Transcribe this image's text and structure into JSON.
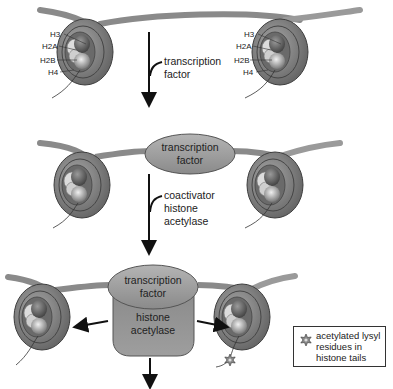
{
  "diagram": {
    "title": "",
    "stage1": {
      "histone_labels_left": [
        "H3",
        "H2A",
        "H2B",
        "H4"
      ],
      "histone_labels_right": [
        "H3",
        "H2A",
        "H2B",
        "H4"
      ],
      "arrow_label_line1": "transcription",
      "arrow_label_line2": "factor"
    },
    "stage2": {
      "tf_label_line1": "transcription",
      "tf_label_line2": "factor",
      "arrow_label_line1": "coactivator",
      "arrow_label_line2": "histone",
      "arrow_label_line3": "acetylase"
    },
    "stage3": {
      "tf_label_line1": "transcription",
      "tf_label_line2": "factor",
      "hat_label_line1": "histone",
      "hat_label_line2": "acetylase"
    },
    "legend": {
      "icon": "acetyl-star-icon",
      "line1": "acetylated lysyl",
      "line2": "residues in",
      "line3": "histone tails"
    },
    "colors": {
      "dna": "#8a8a8a",
      "nucleosome": "#7a7a7a",
      "histone_light": "#c9c9c9",
      "tf_ellipse": "#9c9c9c",
      "arrow": "#111111"
    }
  }
}
